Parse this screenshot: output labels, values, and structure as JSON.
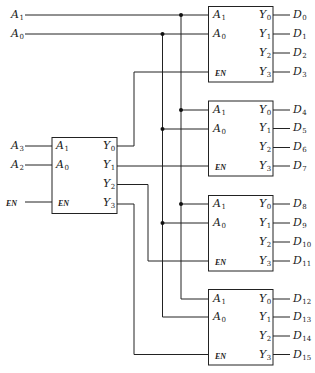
{
  "diagram": {
    "stroke_color": "#222222",
    "external_inputs": [
      {
        "name": "A",
        "sub": "1",
        "y": 15
      },
      {
        "name": "A",
        "sub": "0",
        "y": 34
      },
      {
        "name": "A",
        "sub": "3",
        "y": 146
      },
      {
        "name": "A",
        "sub": "2",
        "y": 165
      },
      {
        "name": "EN",
        "sub": "",
        "y": 202
      }
    ],
    "first_stage_decoder": {
      "pins_in": [
        {
          "name": "A",
          "sub": "1"
        },
        {
          "name": "A",
          "sub": "0"
        },
        {
          "name": "EN",
          "sub": ""
        }
      ],
      "pins_out": [
        {
          "name": "Y",
          "sub": "0"
        },
        {
          "name": "Y",
          "sub": "1"
        },
        {
          "name": "Y",
          "sub": "2"
        },
        {
          "name": "Y",
          "sub": "3"
        }
      ]
    },
    "second_stage_decoders": [
      {
        "pins_in": [
          {
            "name": "A",
            "sub": "1"
          },
          {
            "name": "A",
            "sub": "0"
          },
          {
            "name": "EN",
            "sub": ""
          }
        ],
        "pins_out": [
          {
            "name": "Y",
            "sub": "0"
          },
          {
            "name": "Y",
            "sub": "1"
          },
          {
            "name": "Y",
            "sub": "2"
          },
          {
            "name": "Y",
            "sub": "3"
          }
        ],
        "outputs": [
          {
            "name": "D",
            "sub": "0"
          },
          {
            "name": "D",
            "sub": "1"
          },
          {
            "name": "D",
            "sub": "2"
          },
          {
            "name": "D",
            "sub": "3"
          }
        ]
      },
      {
        "pins_in": [
          {
            "name": "A",
            "sub": "1"
          },
          {
            "name": "A",
            "sub": "0"
          },
          {
            "name": "EN",
            "sub": ""
          }
        ],
        "pins_out": [
          {
            "name": "Y",
            "sub": "0"
          },
          {
            "name": "Y",
            "sub": "1"
          },
          {
            "name": "Y",
            "sub": "2"
          },
          {
            "name": "Y",
            "sub": "3"
          }
        ],
        "outputs": [
          {
            "name": "D",
            "sub": "4"
          },
          {
            "name": "D",
            "sub": "5"
          },
          {
            "name": "D",
            "sub": "6"
          },
          {
            "name": "D",
            "sub": "7"
          }
        ]
      },
      {
        "pins_in": [
          {
            "name": "A",
            "sub": "1"
          },
          {
            "name": "A",
            "sub": "0"
          },
          {
            "name": "EN",
            "sub": ""
          }
        ],
        "pins_out": [
          {
            "name": "Y",
            "sub": "0"
          },
          {
            "name": "Y",
            "sub": "1"
          },
          {
            "name": "Y",
            "sub": "2"
          },
          {
            "name": "Y",
            "sub": "3"
          }
        ],
        "outputs": [
          {
            "name": "D",
            "sub": "8"
          },
          {
            "name": "D",
            "sub": "9"
          },
          {
            "name": "D",
            "sub": "10"
          },
          {
            "name": "D",
            "sub": "11"
          }
        ]
      },
      {
        "pins_in": [
          {
            "name": "A",
            "sub": "1"
          },
          {
            "name": "A",
            "sub": "0"
          },
          {
            "name": "EN",
            "sub": ""
          }
        ],
        "pins_out": [
          {
            "name": "Y",
            "sub": "0"
          },
          {
            "name": "Y",
            "sub": "1"
          },
          {
            "name": "Y",
            "sub": "2"
          },
          {
            "name": "Y",
            "sub": "3"
          }
        ],
        "outputs": [
          {
            "name": "D",
            "sub": "12"
          },
          {
            "name": "D",
            "sub": "13"
          },
          {
            "name": "D",
            "sub": "14"
          },
          {
            "name": "D",
            "sub": "15"
          }
        ]
      }
    ],
    "connections": [
      "A1 bus -> A1 of all second-stage decoders",
      "A0 bus -> A0 of all second-stage decoders",
      "first-stage Y0 -> decoder 1 EN",
      "first-stage Y1 -> decoder 2 EN",
      "first-stage Y2 -> decoder 3 EN",
      "first-stage Y3 -> decoder 4 EN"
    ]
  }
}
